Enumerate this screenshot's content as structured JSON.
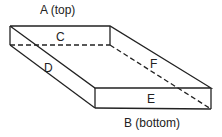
{
  "diagram": {
    "type": "rectangular box faces",
    "labels": {
      "top": "A (top)",
      "bottom": "B (bottom)",
      "c": "C",
      "d": "D",
      "e": "E",
      "f": "F"
    },
    "colors": {
      "line": "#222222",
      "background": "#ffffff"
    }
  }
}
